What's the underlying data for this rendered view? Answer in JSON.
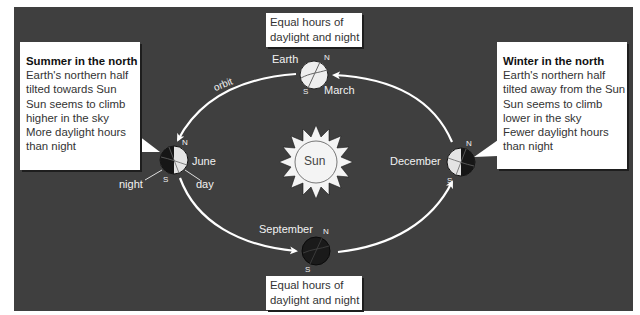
{
  "diagram": {
    "background_color": "#3f3f3f",
    "sun": {
      "label": "Sun"
    },
    "orbit_label": "orbit",
    "earth_label": "Earth",
    "positions": [
      {
        "month": "March",
        "north": "N",
        "south": "S",
        "shading": "lit"
      },
      {
        "month": "June",
        "north": "N",
        "south": "S",
        "shading": "left-dark"
      },
      {
        "month": "September",
        "north": "N",
        "south": "S",
        "shading": "dark"
      },
      {
        "month": "December",
        "north": "N",
        "south": "S",
        "shading": "right-dark"
      }
    ],
    "june_pointers": {
      "night": "night",
      "day": "day"
    }
  },
  "callouts": {
    "summer": {
      "title": "Summer in the north",
      "lines": [
        "Earth's northern half",
        "tilted towards Sun",
        "Sun seems to climb",
        "higher in the sky",
        "More daylight hours",
        "than night"
      ]
    },
    "winter": {
      "title": "Winter in the north",
      "lines": [
        "Earth's northern half",
        "tilted away from the Sun",
        "Sun seems to climb",
        "lower in the sky",
        "Fewer daylight hours",
        "than night"
      ]
    },
    "equinox_top": {
      "lines": [
        "Equal hours of",
        "daylight and night"
      ]
    },
    "equinox_bottom": {
      "lines": [
        "Equal hours of",
        "daylight and night"
      ]
    }
  }
}
